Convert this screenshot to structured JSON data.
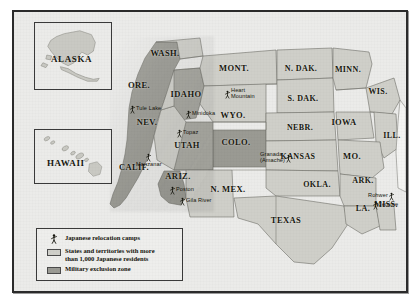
{
  "map": {
    "title": "Japanese American relocation camps and exclusion zones, World War II",
    "colors": {
      "background": "#ebebe9",
      "frame": "#2b2b2b",
      "state_over_1000": "#cfcfc9",
      "exclusion_zone": "#9a9a93",
      "state_plain": "#f4f4f2",
      "state_border": "#6f6f68",
      "text": "#18180f"
    },
    "insets": [
      {
        "name": "alaska",
        "label": "ALASKA"
      },
      {
        "name": "hawaii",
        "label": "HAWAII"
      }
    ],
    "states": [
      {
        "abbr": "WASH.",
        "x": 151,
        "y": 41,
        "size": 8.5
      },
      {
        "abbr": "ORE.",
        "x": 125,
        "y": 73,
        "size": 8.5
      },
      {
        "abbr": "IDAHO",
        "x": 172,
        "y": 82,
        "size": 8.5
      },
      {
        "abbr": "MONT.",
        "x": 220,
        "y": 56,
        "size": 8.5
      },
      {
        "abbr": "N. DAK.",
        "x": 287,
        "y": 56,
        "size": 8.0
      },
      {
        "abbr": "MINN.",
        "x": 334,
        "y": 57,
        "size": 8.0
      },
      {
        "abbr": "S. DAK.",
        "x": 289,
        "y": 86,
        "size": 8.0
      },
      {
        "abbr": "WIS.",
        "x": 364,
        "y": 79,
        "size": 8.0
      },
      {
        "abbr": "WYO.",
        "x": 219,
        "y": 103,
        "size": 8.5
      },
      {
        "abbr": "NEBR.",
        "x": 286,
        "y": 115,
        "size": 8.0
      },
      {
        "abbr": "IOWA",
        "x": 330,
        "y": 110,
        "size": 8.5
      },
      {
        "abbr": "ILL.",
        "x": 378,
        "y": 123,
        "size": 8.0
      },
      {
        "abbr": "NEV.",
        "x": 133,
        "y": 110,
        "size": 8.5
      },
      {
        "abbr": "UTAH",
        "x": 173,
        "y": 133,
        "size": 8.5
      },
      {
        "abbr": "COLO.",
        "x": 222,
        "y": 130,
        "size": 8.5
      },
      {
        "abbr": "KANSAS",
        "x": 284,
        "y": 144,
        "size": 8.0
      },
      {
        "abbr": "MO.",
        "x": 338,
        "y": 144,
        "size": 8.5
      },
      {
        "abbr": "CALIF.",
        "x": 120,
        "y": 155,
        "size": 8.5
      },
      {
        "abbr": "ARIZ.",
        "x": 164,
        "y": 164,
        "size": 8.5
      },
      {
        "abbr": "N. MEX.",
        "x": 214,
        "y": 177,
        "size": 8.5
      },
      {
        "abbr": "OKLA.",
        "x": 303,
        "y": 172,
        "size": 8.0
      },
      {
        "abbr": "ARK.",
        "x": 349,
        "y": 168,
        "size": 8.0
      },
      {
        "abbr": "TEXAS",
        "x": 272,
        "y": 208,
        "size": 8.5
      },
      {
        "abbr": "LA.",
        "x": 349,
        "y": 196,
        "size": 8.0
      },
      {
        "abbr": "MISS.",
        "x": 372,
        "y": 192,
        "size": 8.0
      }
    ],
    "camps": [
      {
        "name": "Tule Lake",
        "x": 116,
        "y": 93,
        "side": "right"
      },
      {
        "name": "Minidoka",
        "x": 172,
        "y": 98,
        "side": "right"
      },
      {
        "name": "Heart\nMountain",
        "x": 211,
        "y": 76,
        "side": "right",
        "stack": true
      },
      {
        "name": "Topaz",
        "x": 163,
        "y": 117,
        "side": "right"
      },
      {
        "name": "Manzanar",
        "x": 122,
        "y": 141,
        "side": "below"
      },
      {
        "name": "Granada\n(Amache)",
        "x": 246,
        "y": 140,
        "side": "left",
        "stack": true
      },
      {
        "name": "Poston",
        "x": 156,
        "y": 174,
        "side": "right"
      },
      {
        "name": "Gila River",
        "x": 166,
        "y": 185,
        "side": "right"
      },
      {
        "name": "Rohwer",
        "x": 354,
        "y": 180,
        "side": "left"
      },
      {
        "name": "Jerome",
        "x": 359,
        "y": 189,
        "side": "right"
      }
    ],
    "legend": {
      "items": [
        {
          "key": "camp-icon",
          "label": "Japanese relocation camps",
          "label_line2": ""
        },
        {
          "key": "swatch-light",
          "color": "#cfcfc9",
          "label": "States and territories with more",
          "label_line2": "than 1,000 Japanese residents"
        },
        {
          "key": "swatch-dark",
          "color": "#9a9a93",
          "label": "Military exclusion zone",
          "label_line2": ""
        }
      ]
    }
  }
}
